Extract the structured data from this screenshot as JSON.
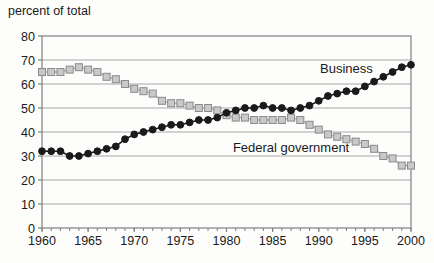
{
  "chart_data": {
    "type": "line",
    "title": "percent of total",
    "x": [
      1960,
      1961,
      1962,
      1963,
      1964,
      1965,
      1966,
      1967,
      1968,
      1969,
      1970,
      1971,
      1972,
      1973,
      1974,
      1975,
      1976,
      1977,
      1978,
      1979,
      1980,
      1981,
      1982,
      1983,
      1984,
      1985,
      1986,
      1987,
      1988,
      1989,
      1990,
      1991,
      1992,
      1993,
      1994,
      1995,
      1996,
      1997,
      1998,
      1999,
      2000
    ],
    "xlim": [
      1960,
      2000
    ],
    "ylim": [
      0,
      80
    ],
    "grid": "horizontal-only",
    "legend": "inline-annotations",
    "y_tick_labels": [
      "0",
      "10",
      "20",
      "30",
      "40",
      "50",
      "60",
      "70",
      "80"
    ],
    "x_tick_labels": [
      "1960",
      "1965",
      "1970",
      "1975",
      "1980",
      "1985",
      "1990",
      "1995",
      "2000"
    ],
    "x_minor_tick_every": 1,
    "series": [
      {
        "name": "Federal government",
        "marker": "square",
        "marker_fill": "#c9c9c9",
        "marker_edge": "#8a8a8a",
        "line_color": "#b5b5b5",
        "values": [
          65,
          65,
          65,
          66,
          67,
          66,
          65,
          63,
          62,
          60,
          58,
          57,
          56,
          53,
          52,
          52,
          51,
          50,
          50,
          49,
          47,
          46,
          46,
          45,
          45,
          45,
          45,
          46,
          45,
          43,
          41,
          39,
          38,
          37,
          36,
          35,
          33,
          30,
          29,
          26,
          26
        ]
      },
      {
        "name": "Business",
        "marker": "circle",
        "marker_fill": "#1a1a1a",
        "marker_edge": "#1a1a1a",
        "line_color": "#1a1a1a",
        "values": [
          32,
          32,
          32,
          30,
          30,
          31,
          32,
          33,
          34,
          37,
          39,
          40,
          41,
          42,
          43,
          43,
          44,
          45,
          45,
          46,
          48,
          49,
          50,
          50,
          51,
          50,
          50,
          49,
          50,
          51,
          53,
          55,
          56,
          57,
          57,
          59,
          61,
          63,
          65,
          67,
          68
        ]
      }
    ],
    "annotations": [
      {
        "text": "Business",
        "x": 1993,
        "y": 64.5
      },
      {
        "text": "Federal government",
        "x": 1987,
        "y": 31.5
      }
    ],
    "axis_color": "#808080",
    "grid_color": "#a8a8a8",
    "text_color": "#1a1a1a",
    "background": "#ffffff"
  }
}
